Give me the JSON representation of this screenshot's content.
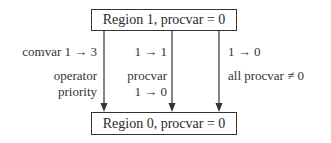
{
  "diagram": {
    "nodes": [
      {
        "id": "region1",
        "label": "Region 1, procvar = 0"
      },
      {
        "id": "region0",
        "label": "Region 0, procvar = 0"
      }
    ],
    "edges": [
      {
        "from": "region1",
        "to": "region0",
        "line1": "comvar 1 → 3",
        "line2": "operator",
        "line3": "priority"
      },
      {
        "from": "region1",
        "to": "region0",
        "line1": "1 → 1",
        "line2": "procvar",
        "line3": "1 → 0"
      },
      {
        "from": "region1",
        "to": "region0",
        "line1": "1 → 0",
        "line2": "all procvar ≠ 0"
      }
    ]
  },
  "colors": {
    "line": "#333333",
    "text": "#333333",
    "background": "#ffffff"
  }
}
